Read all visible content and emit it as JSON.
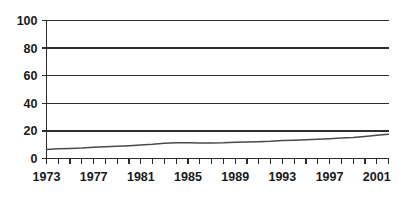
{
  "chart_data": {
    "type": "line",
    "title": "",
    "subtitle": "",
    "xlabel": "",
    "ylabel": "",
    "legend": [],
    "legend_position": "none",
    "grid": "horizontal",
    "xlim": [
      1973,
      2002
    ],
    "ylim": [
      0,
      100
    ],
    "y_ticks": [
      0,
      20,
      40,
      60,
      80,
      100
    ],
    "y_tick_labels": [
      "0",
      "20",
      "40",
      "60",
      "80",
      "100"
    ],
    "x_tick_labels": [
      "1973",
      "1977",
      "1981",
      "1985",
      "1989",
      "1993",
      "1997",
      "2001"
    ],
    "x_tick_label_years": [
      1973,
      1977,
      1981,
      1985,
      1989,
      1993,
      1997,
      2001
    ],
    "x_minor_tick_years": [
      1973,
      1974,
      1975,
      1976,
      1977,
      1978,
      1979,
      1980,
      1981,
      1982,
      1983,
      1984,
      1985,
      1986,
      1987,
      1988,
      1989,
      1990,
      1991,
      1992,
      1993,
      1994,
      1995,
      1996,
      1997,
      1998,
      1999,
      2000,
      2001,
      2002
    ],
    "series": [
      {
        "name": "series-1",
        "color": "#4a4a4a",
        "x": [
          1973,
          1974,
          1975,
          1976,
          1977,
          1978,
          1979,
          1980,
          1981,
          1982,
          1983,
          1984,
          1985,
          1986,
          1987,
          1988,
          1989,
          1990,
          1991,
          1992,
          1993,
          1994,
          1995,
          1996,
          1997,
          1998,
          1999,
          2000,
          2001,
          2002
        ],
        "values": [
          6.5,
          7.0,
          7.3,
          7.6,
          8.1,
          8.5,
          8.9,
          9.3,
          9.8,
          10.3,
          11.0,
          11.5,
          11.5,
          11.3,
          11.3,
          11.4,
          11.7,
          12.0,
          12.2,
          12.5,
          13.0,
          13.3,
          13.6,
          14.0,
          14.4,
          14.8,
          15.3,
          16.0,
          16.8,
          17.5
        ]
      }
    ]
  },
  "axes": {
    "y_axis_name": "value-axis",
    "x_axis_name": "year-axis"
  }
}
